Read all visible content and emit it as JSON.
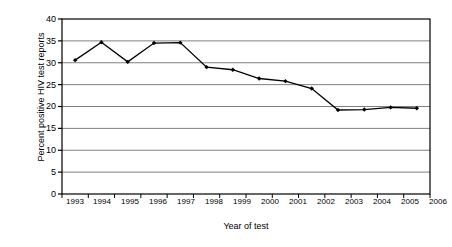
{
  "chart_data": {
    "type": "line",
    "title": "",
    "xlabel": "Year of test",
    "ylabel": "Percent positive HIV test reports",
    "categories": [
      "1993",
      "1994",
      "1995",
      "1996",
      "1997",
      "1998",
      "1999",
      "2000",
      "2001",
      "2002",
      "2003",
      "2004",
      "2005",
      "2006"
    ],
    "values": [
      30.6,
      34.7,
      30.2,
      34.5,
      34.6,
      29.0,
      28.4,
      26.4,
      25.8,
      24.1,
      19.2,
      19.3,
      19.8,
      19.6
    ],
    "series": [
      {
        "name": "Percent positive HIV test reports",
        "values": [
          30.6,
          34.7,
          30.2,
          34.5,
          34.6,
          29.0,
          28.4,
          26.4,
          25.8,
          24.1,
          19.2,
          19.3,
          19.8,
          19.6
        ]
      }
    ],
    "ylim": [
      0,
      40
    ],
    "yticks": [
      0,
      5,
      10,
      15,
      20,
      25,
      30,
      35,
      40
    ],
    "ytick_labels": [
      "0",
      "5",
      "10",
      "15",
      "20",
      "25",
      "30",
      "35",
      "40"
    ],
    "grid": "horizontal",
    "legend": "none",
    "marker": "diamond",
    "line_color": "#000000",
    "grid_color": "#808080",
    "axis_color": "#000000",
    "background": "#ffffff"
  }
}
